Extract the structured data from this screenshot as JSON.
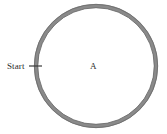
{
  "figure": {
    "width": 167,
    "height": 134,
    "background_color": "#ffffff"
  },
  "diagram": {
    "type": "circular-track",
    "shape_name": "circle",
    "ring": {
      "center_x": 96,
      "center_y": 66,
      "radius": 60,
      "stroke_width": 4,
      "fill_color": "#ffffff",
      "stroke_color": "#858585",
      "edge_color": "#6b6b6b"
    },
    "start_marker": {
      "label": "Start",
      "tick_color": "#3a3a3a",
      "tick_x1": 29,
      "tick_x2": 42,
      "tick_y": 66
    },
    "region": {
      "label": "A",
      "label_x": 94,
      "label_y": 66
    }
  }
}
